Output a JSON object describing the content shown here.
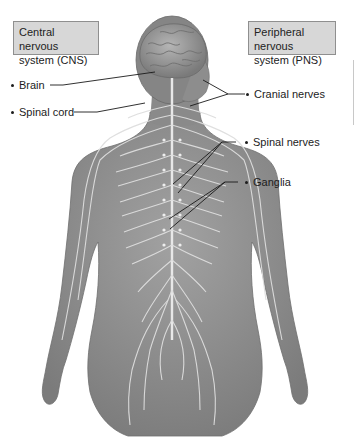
{
  "diagram": {
    "category_boxes": {
      "cns": {
        "line1": "Central nervous",
        "line2": "system (CNS)"
      },
      "pns": {
        "line1": "Peripheral nervous",
        "line2": "system (PNS)"
      }
    },
    "labels": {
      "brain": "Brain",
      "spinal_cord": "Spinal cord",
      "cranial_nerves": "Cranial nerves",
      "spinal_nerves": "Spinal nerves",
      "ganglia": "Ganglia"
    },
    "colors": {
      "box_fill": "#d7d7d7",
      "box_border": "#8f8f8f",
      "body_fill": "#8e8e8e",
      "nerve": "#e6e6e6",
      "leader_line": "#1a1a1a"
    }
  }
}
